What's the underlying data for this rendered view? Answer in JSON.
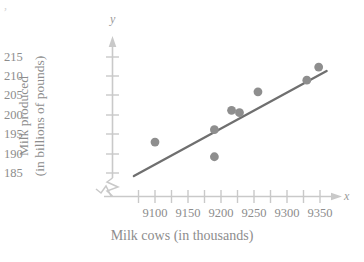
{
  "chart_data": {
    "type": "scatter",
    "title": "",
    "xlabel": "Milk cows (in thousands)",
    "ylabel_line1": "Milk produced",
    "ylabel_line2": "(in billions of pounds)",
    "x_axis_letter": "x",
    "y_axis_letter": "y",
    "xlim": [
      9075,
      9375
    ],
    "ylim": [
      183,
      217
    ],
    "x_ticks": [
      9100,
      9150,
      9200,
      9250,
      9300,
      9350
    ],
    "x_tick_labels": [
      "9100",
      "9150",
      "9200",
      "9250",
      "9300",
      "9350"
    ],
    "x_minor_tick_count": 12,
    "y_ticks": [
      185,
      190,
      195,
      200,
      205,
      210,
      215
    ],
    "y_tick_labels": [
      "185",
      "190",
      "195",
      "200",
      "205",
      "210",
      "215"
    ],
    "y_axis_break": true,
    "grid": false,
    "legend": null,
    "point_color": "#8e8e8e",
    "line_color": "#6f6f6f",
    "axis_color": "#c9c9c9",
    "text_color": "#8d8d8d",
    "points": [
      {
        "x": 9100,
        "y": 193.0
      },
      {
        "x": 9190,
        "y": 196.2
      },
      {
        "x": 9190,
        "y": 189.2
      },
      {
        "x": 9216,
        "y": 201.2
      },
      {
        "x": 9228,
        "y": 200.6
      },
      {
        "x": 9256,
        "y": 206.0
      },
      {
        "x": 9330,
        "y": 209.0
      },
      {
        "x": 9348,
        "y": 212.4
      }
    ],
    "trend_line": {
      "x1": 9068,
      "y1": 184.2,
      "x2": 9360,
      "y2": 211.4
    }
  }
}
